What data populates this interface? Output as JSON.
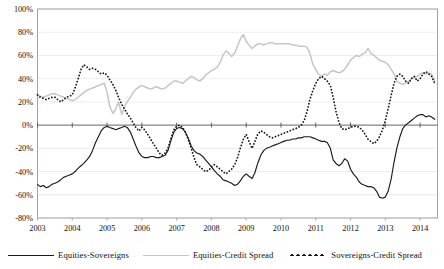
{
  "chart_data": {
    "type": "line",
    "title": "",
    "subtitle": "",
    "xlabel": "",
    "ylabel": "",
    "ylim": [
      -80,
      100
    ],
    "xlim": [
      2003.0,
      2014.5
    ],
    "grid": true,
    "legend_position": "bottom",
    "yticks": [
      "100%",
      "80%",
      "60%",
      "40%",
      "20%",
      "0%",
      "-20%",
      "-40%",
      "-60%",
      "-80%"
    ],
    "ytick_values": [
      100,
      80,
      60,
      40,
      20,
      0,
      -20,
      -40,
      -60,
      -80
    ],
    "xticks": [
      "2003",
      "2004",
      "2005",
      "2006",
      "2007",
      "2008",
      "2009",
      "2010",
      "2011",
      "2012",
      "2013",
      "2014"
    ],
    "xtick_values": [
      2003,
      2004,
      2005,
      2006,
      2007,
      2008,
      2009,
      2010,
      2011,
      2012,
      2013,
      2014
    ],
    "series": [
      {
        "name": "Equities-Sovereigns",
        "style": "solid",
        "color": "#1a1a1a",
        "width": 1.15,
        "x": [
          2003.0,
          2003.08,
          2003.17,
          2003.25,
          2003.33,
          2003.42,
          2003.5,
          2003.58,
          2003.67,
          2003.75,
          2003.83,
          2003.92,
          2004.0,
          2004.08,
          2004.17,
          2004.25,
          2004.33,
          2004.42,
          2004.5,
          2004.58,
          2004.67,
          2004.75,
          2004.83,
          2004.92,
          2005.0,
          2005.08,
          2005.17,
          2005.25,
          2005.33,
          2005.42,
          2005.5,
          2005.58,
          2005.67,
          2005.75,
          2005.83,
          2005.92,
          2006.0,
          2006.08,
          2006.17,
          2006.25,
          2006.33,
          2006.42,
          2006.5,
          2006.58,
          2006.67,
          2006.75,
          2006.83,
          2006.92,
          2007.0,
          2007.08,
          2007.17,
          2007.25,
          2007.33,
          2007.42,
          2007.5,
          2007.58,
          2007.67,
          2007.75,
          2007.83,
          2007.92,
          2008.0,
          2008.08,
          2008.17,
          2008.25,
          2008.33,
          2008.42,
          2008.5,
          2008.58,
          2008.67,
          2008.75,
          2008.83,
          2008.92,
          2009.0,
          2009.08,
          2009.17,
          2009.25,
          2009.33,
          2009.42,
          2009.5,
          2009.58,
          2009.67,
          2009.75,
          2009.83,
          2009.92,
          2010.0,
          2010.08,
          2010.17,
          2010.25,
          2010.33,
          2010.42,
          2010.5,
          2010.58,
          2010.67,
          2010.75,
          2010.83,
          2010.92,
          2011.0,
          2011.08,
          2011.17,
          2011.25,
          2011.33,
          2011.42,
          2011.5,
          2011.58,
          2011.67,
          2011.75,
          2011.83,
          2011.92,
          2012.0,
          2012.08,
          2012.17,
          2012.25,
          2012.33,
          2012.42,
          2012.5,
          2012.58,
          2012.67,
          2012.75,
          2012.83,
          2012.92,
          2013.0,
          2013.08,
          2013.17,
          2013.25,
          2013.33,
          2013.42,
          2013.5,
          2013.58,
          2013.67,
          2013.75,
          2013.83,
          2013.92,
          2014.0,
          2014.08,
          2014.17,
          2014.25,
          2014.33,
          2014.42
        ],
        "values": [
          -51,
          -53,
          -52,
          -54,
          -53,
          -51,
          -50,
          -49,
          -47,
          -45,
          -44,
          -43,
          -42,
          -40,
          -37,
          -35,
          -33,
          -30,
          -27,
          -22,
          -15,
          -10,
          -5,
          -2,
          -1,
          -2,
          -3,
          -4,
          -3,
          -2,
          -1,
          -2,
          -6,
          -12,
          -18,
          -24,
          -27,
          -28,
          -28,
          -27,
          -27,
          -28,
          -28,
          -27,
          -26,
          -22,
          -14,
          -6,
          -3,
          -2,
          -3,
          -6,
          -11,
          -18,
          -22,
          -24,
          -25,
          -27,
          -30,
          -33,
          -36,
          -39,
          -42,
          -44,
          -47,
          -48,
          -49,
          -50,
          -52,
          -51,
          -48,
          -44,
          -42,
          -44,
          -46,
          -41,
          -33,
          -26,
          -22,
          -20,
          -19,
          -18,
          -17,
          -16,
          -15,
          -14,
          -13,
          -13,
          -12,
          -12,
          -11,
          -11,
          -10,
          -10,
          -10,
          -11,
          -12,
          -13,
          -14,
          -14,
          -15,
          -20,
          -30,
          -33,
          -35,
          -33,
          -29,
          -31,
          -38,
          -42,
          -45,
          -49,
          -51,
          -52,
          -53,
          -53,
          -54,
          -57,
          -62,
          -63,
          -62,
          -57,
          -46,
          -32,
          -20,
          -10,
          -3,
          0,
          2,
          4,
          6,
          8,
          9,
          9,
          7,
          8,
          7,
          5
        ]
      },
      {
        "name": "Equities-Credit Spread",
        "style": "solid",
        "color": "#c6c6c6",
        "width": 1.5,
        "x": [
          2003.0,
          2003.08,
          2003.17,
          2003.25,
          2003.33,
          2003.42,
          2003.5,
          2003.58,
          2003.67,
          2003.75,
          2003.83,
          2003.92,
          2004.0,
          2004.08,
          2004.17,
          2004.25,
          2004.33,
          2004.42,
          2004.5,
          2004.58,
          2004.67,
          2004.75,
          2004.83,
          2004.92,
          2005.0,
          2005.08,
          2005.17,
          2005.25,
          2005.33,
          2005.42,
          2005.5,
          2005.58,
          2005.67,
          2005.75,
          2005.83,
          2005.92,
          2006.0,
          2006.08,
          2006.17,
          2006.25,
          2006.33,
          2006.42,
          2006.5,
          2006.58,
          2006.67,
          2006.75,
          2006.83,
          2006.92,
          2007.0,
          2007.08,
          2007.17,
          2007.25,
          2007.33,
          2007.42,
          2007.5,
          2007.58,
          2007.67,
          2007.75,
          2007.83,
          2007.92,
          2008.0,
          2008.08,
          2008.17,
          2008.25,
          2008.33,
          2008.42,
          2008.5,
          2008.58,
          2008.67,
          2008.75,
          2008.83,
          2008.92,
          2009.0,
          2009.08,
          2009.17,
          2009.25,
          2009.33,
          2009.42,
          2009.5,
          2009.58,
          2009.67,
          2009.75,
          2009.83,
          2009.92,
          2010.0,
          2010.08,
          2010.17,
          2010.25,
          2010.33,
          2010.42,
          2010.5,
          2010.58,
          2010.67,
          2010.75,
          2010.83,
          2010.92,
          2011.0,
          2011.08,
          2011.17,
          2011.25,
          2011.33,
          2011.42,
          2011.5,
          2011.58,
          2011.67,
          2011.75,
          2011.83,
          2011.92,
          2012.0,
          2012.08,
          2012.17,
          2012.25,
          2012.33,
          2012.42,
          2012.5,
          2012.58,
          2012.67,
          2012.75,
          2012.83,
          2012.92,
          2013.0,
          2013.08,
          2013.17,
          2013.25,
          2013.33,
          2013.42,
          2013.5,
          2013.58,
          2013.67,
          2013.75,
          2013.83,
          2013.92,
          2014.0,
          2014.08,
          2014.17,
          2014.25,
          2014.33,
          2014.42
        ],
        "values": [
          26,
          25,
          24,
          25,
          26,
          27,
          27,
          26,
          25,
          24,
          23,
          22,
          21,
          22,
          24,
          26,
          28,
          30,
          31,
          32,
          33,
          34,
          35,
          36,
          28,
          16,
          10,
          14,
          20,
          9,
          16,
          20,
          24,
          28,
          31,
          33,
          34,
          33,
          32,
          31,
          32,
          33,
          32,
          31,
          32,
          34,
          36,
          38,
          38,
          37,
          36,
          38,
          40,
          42,
          41,
          39,
          38,
          40,
          43,
          45,
          47,
          48,
          50,
          54,
          60,
          64,
          62,
          59,
          62,
          68,
          74,
          78,
          72,
          69,
          66,
          68,
          70,
          70,
          69,
          70,
          71,
          71,
          70,
          70,
          70,
          70,
          70,
          70,
          69,
          69,
          68,
          68,
          68,
          67,
          62,
          52,
          48,
          44,
          42,
          44,
          43,
          46,
          47,
          46,
          45,
          46,
          48,
          52,
          56,
          58,
          60,
          59,
          61,
          62,
          66,
          62,
          60,
          58,
          56,
          55,
          54,
          52,
          48,
          44,
          38,
          36,
          35,
          36,
          38,
          40,
          41,
          42,
          44,
          45,
          44,
          45,
          44,
          38
        ]
      },
      {
        "name": "Sovereigns-Credit Spread",
        "style": "dotted",
        "color": "#1a1a1a",
        "width": 1.8,
        "x": [
          2003.0,
          2003.08,
          2003.17,
          2003.25,
          2003.33,
          2003.42,
          2003.5,
          2003.58,
          2003.67,
          2003.75,
          2003.83,
          2003.92,
          2004.0,
          2004.08,
          2004.17,
          2004.25,
          2004.33,
          2004.42,
          2004.5,
          2004.58,
          2004.67,
          2004.75,
          2004.83,
          2004.92,
          2005.0,
          2005.08,
          2005.17,
          2005.25,
          2005.33,
          2005.42,
          2005.5,
          2005.58,
          2005.67,
          2005.75,
          2005.83,
          2005.92,
          2006.0,
          2006.08,
          2006.17,
          2006.25,
          2006.33,
          2006.42,
          2006.5,
          2006.58,
          2006.67,
          2006.75,
          2006.83,
          2006.92,
          2007.0,
          2007.08,
          2007.17,
          2007.25,
          2007.33,
          2007.42,
          2007.5,
          2007.58,
          2007.67,
          2007.75,
          2007.83,
          2007.92,
          2008.0,
          2008.08,
          2008.17,
          2008.25,
          2008.33,
          2008.42,
          2008.5,
          2008.58,
          2008.67,
          2008.75,
          2008.83,
          2008.92,
          2009.0,
          2009.08,
          2009.17,
          2009.25,
          2009.33,
          2009.42,
          2009.5,
          2009.58,
          2009.67,
          2009.75,
          2009.83,
          2009.92,
          2010.0,
          2010.08,
          2010.17,
          2010.25,
          2010.33,
          2010.42,
          2010.5,
          2010.58,
          2010.67,
          2010.75,
          2010.83,
          2010.92,
          2011.0,
          2011.08,
          2011.17,
          2011.25,
          2011.33,
          2011.42,
          2011.5,
          2011.58,
          2011.67,
          2011.75,
          2011.83,
          2011.92,
          2012.0,
          2012.08,
          2012.17,
          2012.25,
          2012.33,
          2012.42,
          2012.5,
          2012.58,
          2012.67,
          2012.75,
          2012.83,
          2012.92,
          2013.0,
          2013.08,
          2013.17,
          2013.25,
          2013.33,
          2013.42,
          2013.5,
          2013.58,
          2013.67,
          2013.75,
          2013.83,
          2013.92,
          2014.0,
          2014.08,
          2014.17,
          2014.25,
          2014.33,
          2014.42
        ],
        "values": [
          26,
          24,
          23,
          22,
          23,
          24,
          24,
          22,
          20,
          22,
          24,
          25,
          26,
          32,
          40,
          48,
          52,
          50,
          48,
          49,
          48,
          46,
          44,
          45,
          43,
          39,
          35,
          30,
          24,
          18,
          14,
          10,
          6,
          2,
          -2,
          -5,
          -2,
          -4,
          -8,
          -12,
          -16,
          -20,
          -24,
          -26,
          -24,
          -20,
          -12,
          -4,
          -1,
          0,
          -2,
          -6,
          -12,
          -20,
          -28,
          -34,
          -36,
          -38,
          -40,
          -39,
          -36,
          -34,
          -36,
          -38,
          -40,
          -42,
          -40,
          -38,
          -34,
          -28,
          -20,
          -12,
          -8,
          -14,
          -20,
          -14,
          -8,
          -5,
          -6,
          -8,
          -10,
          -11,
          -10,
          -9,
          -8,
          -7,
          -6,
          -5,
          -4,
          -3,
          -2,
          0,
          4,
          12,
          22,
          30,
          36,
          40,
          42,
          40,
          38,
          34,
          24,
          12,
          2,
          -3,
          -4,
          -3,
          -2,
          -1,
          -1,
          -2,
          -4,
          -8,
          -12,
          -14,
          -16,
          -14,
          -10,
          -4,
          4,
          14,
          26,
          36,
          42,
          44,
          42,
          38,
          36,
          40,
          42,
          38,
          40,
          44,
          46,
          44,
          42,
          36
        ]
      }
    ]
  },
  "legend": {
    "items": [
      {
        "label": "Equities-Sovereigns",
        "style": "solid-dark"
      },
      {
        "label": "Equities-Credit Spread",
        "style": "solid-gray"
      },
      {
        "label": "Sovereigns-Credit Spread",
        "style": "dotted"
      }
    ]
  }
}
